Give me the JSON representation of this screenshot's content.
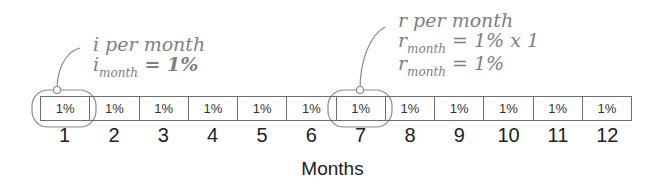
{
  "callouts": [
    {
      "title": "i per month",
      "var": "i",
      "sub": "month",
      "eq1": " = 1%",
      "target_month": 1
    },
    {
      "title": "r per month",
      "var": "r",
      "sub": "month",
      "eq1": " = 1% x 1",
      "eq2": " = 1%",
      "target_month": 7
    }
  ],
  "cells": [
    "1%",
    "1%",
    "1%",
    "1%",
    "1%",
    "1%",
    "1%",
    "1%",
    "1%",
    "1%",
    "1%",
    "1%"
  ],
  "month_labels": [
    "1",
    "2",
    "3",
    "4",
    "5",
    "6",
    "7",
    "8",
    "9",
    "10",
    "11",
    "12"
  ],
  "axis_label": "Months",
  "colors": {
    "annotation": "#808080",
    "border": "#6e6e6e",
    "text": "#222222"
  }
}
